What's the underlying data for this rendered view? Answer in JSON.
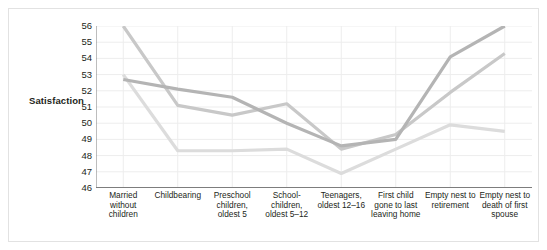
{
  "figure": {
    "background": "#ffffff",
    "frame_color": "#e2e2e2"
  },
  "chart_data": {
    "type": "line",
    "title": "",
    "xlabel": "",
    "ylabel": "Satisfaction",
    "ylim": [
      46,
      56
    ],
    "yticks": [
      56,
      55,
      54,
      53,
      52,
      51,
      50,
      49,
      48,
      47,
      46
    ],
    "grid": true,
    "grid_axes": "both",
    "legend": "none",
    "categories": [
      "Married without children",
      "Childbearing",
      "Preschool children, oldest 5",
      "School-children, oldest 5–12",
      "Teenagers, oldest 12–16",
      "First child gone to last leaving home",
      "Empty nest to retirement",
      "Empty nest to death of first spouse"
    ],
    "series": [
      {
        "name": "series-1",
        "color": "#b4b4b4",
        "values": [
          52.7,
          52.1,
          51.6,
          50.0,
          48.6,
          49.0,
          54.1,
          56.0
        ]
      },
      {
        "name": "series-2",
        "color": "#c8c8c8",
        "values": [
          56.0,
          51.1,
          50.5,
          51.2,
          48.4,
          49.3,
          51.9,
          54.3
        ]
      },
      {
        "name": "series-3",
        "color": "#dcdcdc",
        "values": [
          53.0,
          48.3,
          48.3,
          48.4,
          46.9,
          48.4,
          49.9,
          49.5
        ]
      }
    ]
  }
}
